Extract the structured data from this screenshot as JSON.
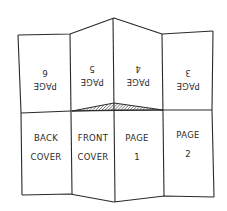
{
  "diagram": {
    "colors": {
      "line": "#2a2a2a",
      "text": "#2b2b2b",
      "background": "#ffffff"
    },
    "top_row": [
      {
        "id": "page-6",
        "line1": "PAGE",
        "line2": "6",
        "orientation": "upside-down"
      },
      {
        "id": "page-5",
        "line1": "PAGE",
        "line2": "5",
        "orientation": "upside-down"
      },
      {
        "id": "page-4",
        "line1": "PAGE",
        "line2": "4",
        "orientation": "upside-down"
      },
      {
        "id": "page-3",
        "line1": "PAGE",
        "line2": "3",
        "orientation": "upside-down"
      }
    ],
    "bottom_row": [
      {
        "id": "back-cover",
        "line1": "BACK",
        "line2": "COVER",
        "orientation": "upright"
      },
      {
        "id": "front-cover",
        "line1": "FRONT",
        "line2": "COVER",
        "orientation": "upright"
      },
      {
        "id": "page-1",
        "line1": "PAGE",
        "line2": "1",
        "orientation": "upright"
      },
      {
        "id": "page-2",
        "line1": "PAGE",
        "line2": "2",
        "orientation": "upright"
      }
    ],
    "center_slit": {
      "style": "hatched",
      "description": "cut line between front cover and page 1"
    }
  }
}
